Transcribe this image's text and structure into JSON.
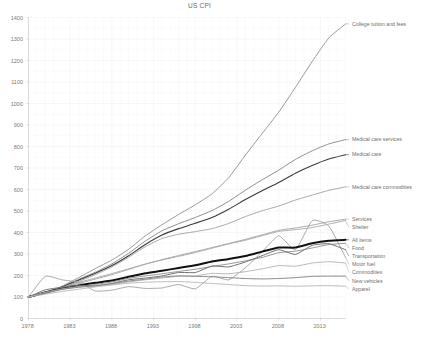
{
  "header": {
    "title": "US CPI"
  },
  "axes": {
    "y_ticks": [
      "0",
      "100",
      "200",
      "300",
      "400",
      "500",
      "600",
      "700",
      "800",
      "900",
      "1000",
      "1100",
      "1200",
      "1300",
      "1400"
    ],
    "x_ticks": [
      "1978",
      "1983",
      "1988",
      "1993",
      "1998",
      "2003",
      "2008",
      "2013"
    ],
    "grid": "on",
    "grid_color": "#eeeef2",
    "axis_color": "#cfcfcf"
  },
  "chart_data": {
    "type": "line",
    "title": "US CPI",
    "xlabel": "",
    "ylabel": "",
    "xlim": [
      1978,
      2016
    ],
    "ylim": [
      0,
      1400
    ],
    "x_tick_values": [
      1978,
      1983,
      1988,
      1993,
      1998,
      2003,
      2008,
      2013
    ],
    "y_tick_values": [
      0,
      100,
      200,
      300,
      400,
      500,
      600,
      700,
      800,
      900,
      1000,
      1100,
      1200,
      1300,
      1400
    ],
    "grid": true,
    "legend_position": "right-inline-labels",
    "note": "All series indexed to 100 at 1978. Values sampled every 2 years from 1978 to 2016.",
    "x": [
      1978,
      1980,
      1982,
      1984,
      1986,
      1988,
      1990,
      1992,
      1994,
      1996,
      1998,
      2000,
      2002,
      2004,
      2006,
      2008,
      2010,
      2012,
      2014,
      2016
    ],
    "series": [
      {
        "name": "College tuition and fees",
        "color": "#9a9a9a",
        "width": 1.0,
        "values": [
          100,
          118,
          150,
          190,
          232,
          272,
          322,
          384,
          436,
          484,
          529,
          580,
          655,
          760,
          860,
          960,
          1075,
          1195,
          1305,
          1370
        ]
      },
      {
        "name": "Medical care services",
        "color": "#8d8d8d",
        "width": 1.0,
        "values": [
          100,
          120,
          148,
          182,
          215,
          254,
          303,
          360,
          408,
          441,
          470,
          502,
          545,
          597,
          645,
          690,
          740,
          780,
          812,
          832
        ]
      },
      {
        "name": "Medical care",
        "color": "#3a3a3a",
        "width": 1.1,
        "values": [
          100,
          119,
          146,
          178,
          210,
          246,
          292,
          344,
          388,
          418,
          443,
          470,
          508,
          553,
          594,
          633,
          676,
          712,
          742,
          762
        ]
      },
      {
        "name": "Medical care commodities",
        "color": "#9f9f9f",
        "width": 0.9,
        "values": [
          100,
          117,
          141,
          172,
          204,
          240,
          285,
          334,
          372,
          392,
          404,
          418,
          442,
          474,
          501,
          523,
          551,
          574,
          596,
          612
        ]
      },
      {
        "name": "Services",
        "color": "#9f9f9f",
        "width": 0.9,
        "values": [
          100,
          121,
          142,
          163,
          183,
          204,
          228,
          253,
          274,
          293,
          311,
          330,
          349,
          368,
          389,
          410,
          421,
          434,
          450,
          462
        ]
      },
      {
        "name": "Shelter",
        "color": "#a6a6a6",
        "width": 0.9,
        "values": [
          100,
          124,
          145,
          168,
          188,
          209,
          231,
          253,
          272,
          289,
          307,
          327,
          347,
          364,
          385,
          405,
          413,
          423,
          439,
          456
        ]
      },
      {
        "name": "Motor fuel",
        "color": "#a2a2a2",
        "width": 0.9,
        "values": [
          100,
          196,
          180,
          168,
          128,
          132,
          148,
          140,
          142,
          158,
          138,
          196,
          180,
          236,
          310,
          385,
          320,
          455,
          430,
          285
        ]
      },
      {
        "name": "All items",
        "color": "#111111",
        "width": 2.0,
        "values": [
          100,
          121,
          139,
          154,
          166,
          177,
          194,
          210,
          222,
          235,
          248,
          265,
          277,
          291,
          311,
          330,
          330,
          350,
          362,
          366
        ]
      },
      {
        "name": "Food",
        "color": "#8a8a8a",
        "width": 0.9,
        "values": [
          100,
          120,
          138,
          148,
          158,
          170,
          187,
          198,
          208,
          219,
          229,
          242,
          254,
          268,
          284,
          306,
          313,
          328,
          344,
          350
        ]
      },
      {
        "name": "Transportation",
        "color": "#6f6f6f",
        "width": 1.0,
        "values": [
          100,
          133,
          145,
          154,
          152,
          163,
          180,
          188,
          198,
          214,
          214,
          244,
          240,
          263,
          292,
          320,
          298,
          340,
          348,
          320
        ]
      },
      {
        "name": "Commodities",
        "color": "#b0b0b0",
        "width": 0.9,
        "values": [
          100,
          122,
          137,
          148,
          151,
          158,
          170,
          180,
          188,
          197,
          198,
          210,
          208,
          218,
          231,
          246,
          243,
          258,
          264,
          258
        ]
      },
      {
        "name": "New vehicles",
        "color": "#8a8a8a",
        "width": 1.0,
        "values": [
          100,
          117,
          135,
          145,
          152,
          162,
          174,
          183,
          193,
          198,
          196,
          194,
          190,
          186,
          184,
          186,
          190,
          196,
          197,
          197
        ]
      },
      {
        "name": "Apparel",
        "color": "#b6b6b6",
        "width": 0.9,
        "values": [
          100,
          113,
          126,
          136,
          147,
          156,
          164,
          169,
          171,
          172,
          168,
          163,
          158,
          153,
          151,
          152,
          150,
          152,
          153,
          150
        ]
      }
    ],
    "series_labels": [
      {
        "text": "College tuition and fees",
        "value": 1370
      },
      {
        "text": "Medical care services",
        "value": 832
      },
      {
        "text": "Medical care",
        "value": 762
      },
      {
        "text": "Medical care commodities",
        "value": 612
      },
      {
        "text": "Services",
        "value": 462
      },
      {
        "text": "Shelter",
        "value": 456
      },
      {
        "text": "Motor fuel",
        "value": 285
      },
      {
        "text": "All items",
        "value": 366
      },
      {
        "text": "Food",
        "value": 350
      },
      {
        "text": "Transportation",
        "value": 320
      },
      {
        "text": "Commodities",
        "value": 258
      },
      {
        "text": "New vehicles",
        "value": 197
      },
      {
        "text": "Apparel",
        "value": 150
      }
    ]
  }
}
